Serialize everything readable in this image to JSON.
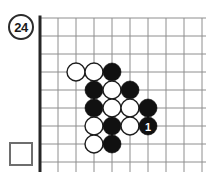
{
  "diagram": {
    "kind": "go-problem-diagram",
    "problem_number": "24",
    "answer_box_value": "",
    "board": {
      "cell_size": 18,
      "origin_x": 10,
      "origin_y": 10,
      "cols": 10,
      "rows": 9,
      "left_edge_is_board_border": true,
      "bottom_edge_is_board_border": true,
      "grid_color": "#8e8e8e",
      "edge_color": "#262626"
    },
    "stones": [
      {
        "id": "w-a",
        "color": "white",
        "col": 2,
        "row": 3,
        "label": ""
      },
      {
        "id": "w-b",
        "color": "white",
        "col": 3,
        "row": 3,
        "label": ""
      },
      {
        "id": "b-a",
        "color": "black",
        "col": 4,
        "row": 3,
        "label": ""
      },
      {
        "id": "b-b",
        "color": "black",
        "col": 3,
        "row": 4,
        "label": ""
      },
      {
        "id": "w-c",
        "color": "white",
        "col": 4,
        "row": 4,
        "label": ""
      },
      {
        "id": "b-c",
        "color": "black",
        "col": 5,
        "row": 4,
        "label": ""
      },
      {
        "id": "b-d",
        "color": "black",
        "col": 3,
        "row": 5,
        "label": ""
      },
      {
        "id": "w-d",
        "color": "white",
        "col": 4,
        "row": 5,
        "label": ""
      },
      {
        "id": "w-e",
        "color": "white",
        "col": 5,
        "row": 5,
        "label": ""
      },
      {
        "id": "b-e",
        "color": "black",
        "col": 6,
        "row": 5,
        "label": ""
      },
      {
        "id": "w-f",
        "color": "white",
        "col": 3,
        "row": 6,
        "label": ""
      },
      {
        "id": "b-f",
        "color": "black",
        "col": 4,
        "row": 6,
        "label": ""
      },
      {
        "id": "w-g",
        "color": "white",
        "col": 5,
        "row": 6,
        "label": ""
      },
      {
        "id": "b-move1",
        "color": "black",
        "col": 6,
        "row": 6,
        "label": "1"
      },
      {
        "id": "w-h",
        "color": "white",
        "col": 3,
        "row": 7,
        "label": ""
      },
      {
        "id": "b-g",
        "color": "black",
        "col": 4,
        "row": 7,
        "label": ""
      }
    ]
  }
}
